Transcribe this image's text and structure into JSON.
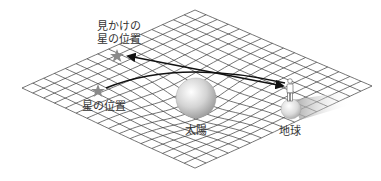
{
  "diagram": {
    "title": "",
    "labels": {
      "apparent_star_line1": "見かけの",
      "apparent_star_line2": "星の位置",
      "actual_star": "星の位置",
      "sun": "太陽",
      "earth": "地球"
    },
    "nodes": [
      {
        "id": "apparent-star",
        "label": "見かけの星の位置",
        "shape": "star",
        "color": "#8a8a8a"
      },
      {
        "id": "actual-star",
        "label": "星の位置",
        "shape": "star",
        "color": "#8a8a8a"
      },
      {
        "id": "sun",
        "label": "太陽",
        "shape": "sphere",
        "color": "#c8c8c8"
      },
      {
        "id": "earth",
        "label": "地球",
        "shape": "sphere",
        "color": "#d0d0d0"
      },
      {
        "id": "observer",
        "label": "",
        "shape": "person",
        "color": "#ffffff"
      }
    ],
    "edges": [
      {
        "from": "actual-star",
        "to": "observer",
        "type": "curved-light-path",
        "note": "light bent around the sun"
      },
      {
        "from": "observer",
        "to": "apparent-star",
        "type": "straight-line-of-sight",
        "arrow": "double"
      }
    ],
    "colors": {
      "grid": "#3a3a3a",
      "line": "#111111",
      "star": "#8a8a8a",
      "text": "#333333"
    }
  }
}
